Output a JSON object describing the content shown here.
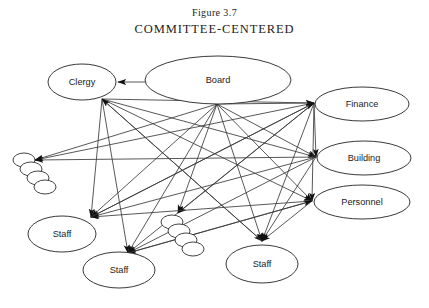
{
  "figure": {
    "number": "Figure 3.7",
    "title": "COMMITTEE-CENTERED"
  },
  "diagram": {
    "type": "network-diagram",
    "background_color": "#ffffff",
    "line_color": "#3a3a3a",
    "node_stroke_color": "#222222",
    "text_color": "#1b1b1b",
    "nodes": [
      {
        "id": "clergy",
        "label": "Clergy",
        "cx": 82,
        "cy": 82,
        "rx": 34,
        "ry": 18
      },
      {
        "id": "board",
        "label": "Board",
        "cx": 218,
        "cy": 80,
        "rx": 73,
        "ry": 24
      },
      {
        "id": "finance",
        "label": "Finance",
        "cx": 362,
        "cy": 104,
        "rx": 47,
        "ry": 17
      },
      {
        "id": "building",
        "label": "Building",
        "cx": 364,
        "cy": 158,
        "rx": 47,
        "ry": 17
      },
      {
        "id": "personnel",
        "label": "Personnel",
        "cx": 362,
        "cy": 202,
        "rx": 48,
        "ry": 17
      },
      {
        "id": "staff1",
        "label": "Staff",
        "cx": 62,
        "cy": 234,
        "rx": 34,
        "ry": 18
      },
      {
        "id": "staff2",
        "label": "Staff",
        "cx": 119,
        "cy": 270,
        "rx": 36,
        "ry": 18
      },
      {
        "id": "staff3",
        "label": "Staff",
        "cx": 262,
        "cy": 264,
        "rx": 36,
        "ry": 19
      }
    ],
    "stacks": [
      {
        "id": "stack-left",
        "count": 4,
        "x": 24,
        "y": 160,
        "rx": 11,
        "ry": 7,
        "dx": 7,
        "dy": 9
      },
      {
        "id": "stack-middle",
        "count": 4,
        "x": 172,
        "y": 222,
        "rx": 11,
        "ry": 7,
        "dx": 7,
        "dy": 9
      }
    ],
    "hubs": {
      "clergy_bottom": {
        "x": 102,
        "y": 99
      },
      "board_bottom": {
        "x": 217,
        "y": 104
      },
      "board_left": {
        "x": 148,
        "y": 82
      },
      "finance_left": {
        "x": 314,
        "y": 103
      },
      "building_left": {
        "x": 316,
        "y": 157
      },
      "personnel_left": {
        "x": 312,
        "y": 201
      },
      "staff1_top": {
        "x": 91,
        "y": 217
      },
      "staff2_top": {
        "x": 128,
        "y": 253
      },
      "staff3_top": {
        "x": 262,
        "y": 241
      },
      "stack_left_tip": {
        "x": 35,
        "y": 160
      },
      "stack_mid_tip": {
        "x": 178,
        "y": 213
      }
    },
    "edges": [
      {
        "from": "board_left",
        "to": "clergy_right",
        "arrow": true
      },
      {
        "from": "clergy_bottom",
        "to": "finance_left",
        "arrow": true
      },
      {
        "from": "clergy_bottom",
        "to": "building_left",
        "arrow": true
      },
      {
        "from": "clergy_bottom",
        "to": "personnel_left",
        "arrow": true
      },
      {
        "from": "clergy_bottom",
        "to": "staff1_top",
        "arrow": true
      },
      {
        "from": "clergy_bottom",
        "to": "staff2_top",
        "arrow": true
      },
      {
        "from": "clergy_bottom",
        "to": "staff3_top",
        "arrow": true
      },
      {
        "from": "board_bottom",
        "to": "finance_left",
        "arrow": true
      },
      {
        "from": "board_bottom",
        "to": "building_left",
        "arrow": true
      },
      {
        "from": "board_bottom",
        "to": "personnel_left",
        "arrow": true
      },
      {
        "from": "board_bottom",
        "to": "staff1_top",
        "arrow": true
      },
      {
        "from": "board_bottom",
        "to": "staff2_top",
        "arrow": true
      },
      {
        "from": "board_bottom",
        "to": "staff3_top",
        "arrow": true
      },
      {
        "from": "board_bottom",
        "to": "stack_left_tip",
        "arrow": true
      },
      {
        "from": "board_bottom",
        "to": "stack_mid_tip",
        "arrow": true
      },
      {
        "from": "finance_left",
        "to": "building_left",
        "arrow": true
      },
      {
        "from": "finance_left",
        "to": "personnel_left",
        "arrow": true
      },
      {
        "from": "finance_left",
        "to": "staff1_top",
        "arrow": true
      },
      {
        "from": "finance_left",
        "to": "staff2_top",
        "arrow": true
      },
      {
        "from": "finance_left",
        "to": "staff3_top",
        "arrow": true
      },
      {
        "from": "finance_left",
        "to": "stack_left_tip",
        "arrow": true
      },
      {
        "from": "finance_left",
        "to": "stack_mid_tip",
        "arrow": true
      },
      {
        "from": "building_left",
        "to": "staff1_top",
        "arrow": true
      },
      {
        "from": "building_left",
        "to": "staff2_top",
        "arrow": true
      },
      {
        "from": "building_left",
        "to": "staff3_top",
        "arrow": true
      },
      {
        "from": "building_left",
        "to": "stack_left_tip",
        "arrow": true
      },
      {
        "from": "personnel_left",
        "to": "staff1_top",
        "arrow": true
      },
      {
        "from": "personnel_left",
        "to": "staff2_top",
        "arrow": true
      },
      {
        "from": "personnel_left",
        "to": "staff3_top",
        "arrow": true
      },
      {
        "from": "staff1_top",
        "to": "finance_left",
        "arrow": true
      },
      {
        "from": "staff2_top",
        "to": "personnel_left",
        "arrow": true
      },
      {
        "from": "staff3_top",
        "to": "clergy_bottom",
        "arrow": true
      }
    ]
  }
}
